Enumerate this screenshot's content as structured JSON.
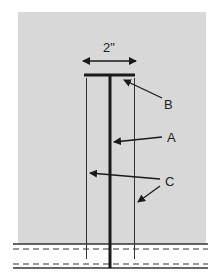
{
  "diagram": {
    "dimension_label": "2\"",
    "labels": {
      "a": "A",
      "b": "B",
      "c": "C"
    },
    "colors": {
      "background": "#d8d8d8",
      "line": "#1a1a1a"
    }
  }
}
